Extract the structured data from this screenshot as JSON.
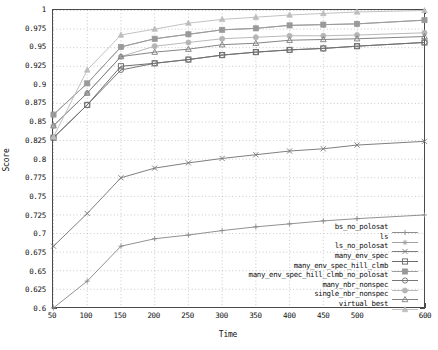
{
  "axes": {
    "xlabel": "Time",
    "ylabel": "Score",
    "xticks": [
      "50",
      "100",
      "150",
      "200",
      "250",
      "300",
      "350",
      "400",
      "450",
      "500",
      "600"
    ],
    "yticks": [
      "1",
      "0.975",
      "0.95",
      "0.925",
      "0.9",
      "0.875",
      "0.85",
      "0.825",
      "0.8",
      "0.775",
      "0.75",
      "0.725",
      "0.7",
      "0.675",
      "0.65",
      "0.625",
      "0.6"
    ]
  },
  "chart_data": {
    "type": "line",
    "title": "",
    "xlabel": "Time",
    "ylabel": "Score",
    "xlim": [
      50,
      600
    ],
    "ylim": [
      0.6,
      1.0
    ],
    "grid": true,
    "legend_position": "bottom-right",
    "x": [
      50,
      100,
      150,
      200,
      250,
      300,
      350,
      400,
      450,
      500,
      600
    ],
    "xtick_values": [
      50,
      100,
      150,
      200,
      250,
      300,
      350,
      400,
      450,
      500,
      600
    ],
    "ytick_values": [
      1,
      0.975,
      0.95,
      0.925,
      0.9,
      0.875,
      0.85,
      0.825,
      0.8,
      0.775,
      0.75,
      0.725,
      0.7,
      0.675,
      0.65,
      0.625,
      0.6
    ],
    "series": [
      {
        "name": "bs_no_polosat",
        "marker": "plus",
        "color": "#8a8a8a",
        "values": [
          0.6,
          0.636,
          0.683,
          0.693,
          0.698,
          0.704,
          0.709,
          0.713,
          0.717,
          0.72,
          0.725
        ]
      },
      {
        "name": "ls",
        "marker": "asterisk",
        "color": "#9c9c9c",
        "values": [
          0.86,
          0.902,
          0.951,
          0.962,
          0.968,
          0.974,
          0.976,
          0.98,
          0.981,
          0.982,
          0.987
        ]
      },
      {
        "name": "ls_no_polosat",
        "marker": "cross",
        "color": "#777777",
        "values": [
          0.683,
          0.727,
          0.775,
          0.788,
          0.795,
          0.801,
          0.806,
          0.811,
          0.814,
          0.819,
          0.824
        ]
      },
      {
        "name": "many_env_spec",
        "marker": "square-open",
        "color": "#666666",
        "values": [
          0.829,
          0.873,
          0.925,
          0.929,
          0.934,
          0.94,
          0.944,
          0.947,
          0.949,
          0.952,
          0.957
        ]
      },
      {
        "name": "many_env_spec_hill_clmb",
        "marker": "square-filled",
        "color": "#999999",
        "values": [
          0.86,
          0.902,
          0.951,
          0.962,
          0.968,
          0.974,
          0.976,
          0.98,
          0.981,
          0.982,
          0.987
        ]
      },
      {
        "name": "many_env_spec_hill_clmb_no_polosat",
        "marker": "circle-open",
        "color": "#707070",
        "values": [
          0.829,
          0.873,
          0.92,
          0.929,
          0.934,
          0.94,
          0.944,
          0.947,
          0.949,
          0.952,
          0.957
        ]
      },
      {
        "name": "many_nbr_nonspec",
        "marker": "circle-filled",
        "color": "#b5b5b5",
        "values": [
          0.845,
          0.889,
          0.938,
          0.952,
          0.957,
          0.962,
          0.964,
          0.966,
          0.966,
          0.967,
          0.97
        ]
      },
      {
        "name": "single_nbr_nonspec",
        "marker": "triangle-open",
        "color": "#7d7d7d",
        "values": [
          0.845,
          0.889,
          0.938,
          0.944,
          0.948,
          0.954,
          0.956,
          0.96,
          0.961,
          0.962,
          0.965
        ]
      },
      {
        "name": "virtual_best",
        "marker": "triangle-filled",
        "color": "#bdbdbd",
        "values": [
          0.83,
          0.92,
          0.967,
          0.975,
          0.983,
          0.988,
          0.991,
          0.994,
          0.996,
          0.998,
          1.0
        ]
      }
    ]
  },
  "legend": {
    "entries": [
      {
        "label": "bs_no_polosat",
        "marker": "plus",
        "color": "#8a8a8a"
      },
      {
        "label": "ls",
        "marker": "asterisk",
        "color": "#9c9c9c"
      },
      {
        "label": "ls_no_polosat",
        "marker": "cross",
        "color": "#777777"
      },
      {
        "label": "many_env_spec",
        "marker": "square-open",
        "color": "#666666"
      },
      {
        "label": "many_env_spec_hill_clmb",
        "marker": "square-filled",
        "color": "#999999"
      },
      {
        "label": "many_env_spec_hill_clmb_no_polosat",
        "marker": "circle-open",
        "color": "#707070"
      },
      {
        "label": "many_nbr_nonspec",
        "marker": "circle-filled",
        "color": "#b5b5b5"
      },
      {
        "label": "single_nbr_nonspec",
        "marker": "triangle-open",
        "color": "#7d7d7d"
      },
      {
        "label": "virtual_best",
        "marker": "triangle-filled",
        "color": "#bdbdbd"
      }
    ]
  }
}
